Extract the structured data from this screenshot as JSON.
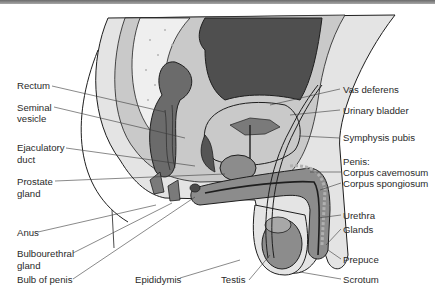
{
  "figure": {
    "colors": {
      "dark_tissue": "#4f4f4f",
      "mid_tissue": "#7a7a7a",
      "light_tissue": "#c9c9c9",
      "pale_tissue": "#e4e4e4",
      "outline": "#1e1e1e",
      "label_text": "#2a2a2a",
      "leader_line": "#3a3a3a"
    }
  },
  "labels_left": [
    {
      "id": "rectum",
      "text": "Rectum"
    },
    {
      "id": "seminal-vesicle-1",
      "text": "Seminal"
    },
    {
      "id": "seminal-vesicle-2",
      "text": "vesicle"
    },
    {
      "id": "ejaculatory-duct-1",
      "text": "Ejaculatory"
    },
    {
      "id": "ejaculatory-duct-2",
      "text": "duct"
    },
    {
      "id": "prostate-gland-1",
      "text": "Prostate"
    },
    {
      "id": "prostate-gland-2",
      "text": "gland"
    },
    {
      "id": "anus",
      "text": "Anus"
    },
    {
      "id": "bulbourethral-gland-1",
      "text": "Bulbourethral"
    },
    {
      "id": "bulbourethral-gland-2",
      "text": "gland"
    },
    {
      "id": "bulb-of-penis",
      "text": "Bulb of penis"
    }
  ],
  "labels_bottom": [
    {
      "id": "epididymis",
      "text": "Epididymis"
    },
    {
      "id": "testis",
      "text": "Testis"
    }
  ],
  "labels_right": [
    {
      "id": "vas-deferens",
      "text": "Vas deferens"
    },
    {
      "id": "urinary-bladder",
      "text": "Urinary bladder"
    },
    {
      "id": "symphysis-pubis",
      "text": "Symphysis pubis"
    },
    {
      "id": "penis",
      "text": "Penis:"
    },
    {
      "id": "corpus-cavernosum",
      "text": "Corpus cavemosum"
    },
    {
      "id": "corpus-spongiosum",
      "text": "Corpus spongiosum"
    },
    {
      "id": "urethra",
      "text": "Urethra"
    },
    {
      "id": "glands",
      "text": "Glands"
    },
    {
      "id": "prepuce",
      "text": "Prepuce"
    },
    {
      "id": "scrotum",
      "text": "Scrotum"
    }
  ]
}
